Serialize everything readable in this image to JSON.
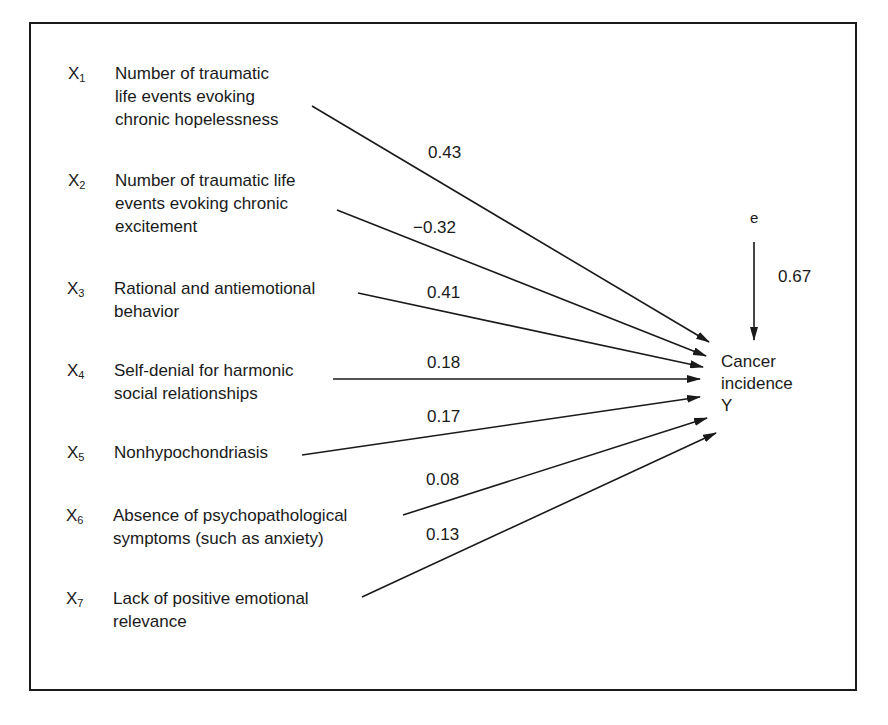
{
  "diagram": {
    "type": "path-diagram",
    "predictors": [
      {
        "symbol": "X",
        "index": "1",
        "desc": "Number of traumatic\nlife events evoking\nchronic hopelessness",
        "weight": "0.43"
      },
      {
        "symbol": "X",
        "index": "2",
        "desc": "Number of traumatic life\nevents evoking chronic\nexcitement",
        "weight": "−0.32"
      },
      {
        "symbol": "X",
        "index": "3",
        "desc": "Rational and antiemotional\nbehavior",
        "weight": "0.41"
      },
      {
        "symbol": "X",
        "index": "4",
        "desc": "Self-denial for harmonic\nsocial relationships",
        "weight": "0.18"
      },
      {
        "symbol": "X",
        "index": "5",
        "desc": "Nonhypochondriasis",
        "weight": "0.17"
      },
      {
        "symbol": "X",
        "index": "6",
        "desc": "Absence of psychopathological\nsymptoms (such as anxiety)",
        "weight": "0.08"
      },
      {
        "symbol": "X",
        "index": "7",
        "desc": "Lack of positive emotional\nrelevance",
        "weight": "0.13"
      }
    ],
    "error": {
      "label": "e",
      "weight": "0.67"
    },
    "outcome": {
      "line1": "Cancer",
      "line2": "incidence",
      "line3": "Y"
    }
  }
}
